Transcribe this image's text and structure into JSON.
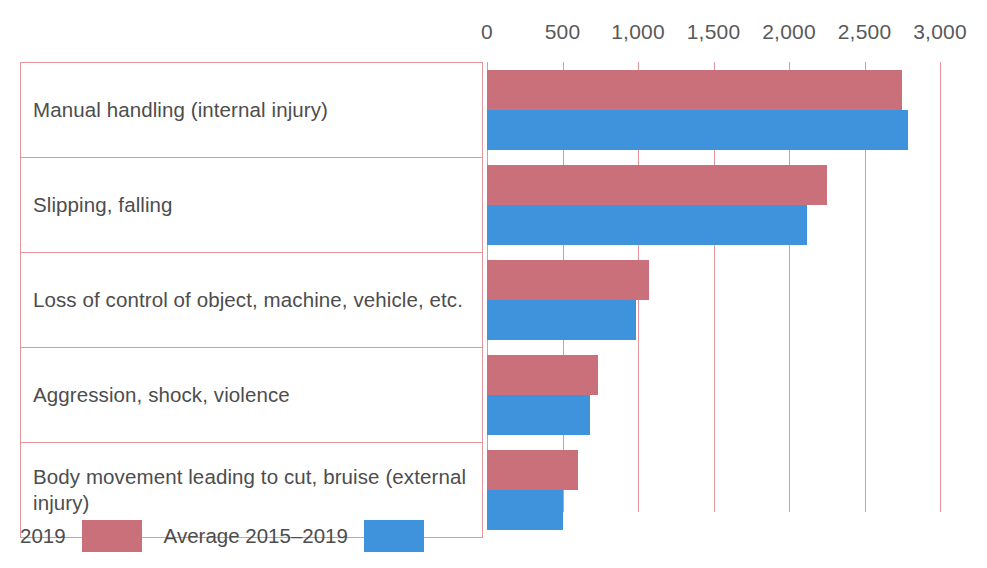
{
  "chart_data": {
    "type": "bar",
    "orientation": "horizontal",
    "title": "",
    "subtitle": "",
    "xlabel": "",
    "ylabel": "",
    "xlim": [
      0,
      3000
    ],
    "grid": true,
    "legend_position": "bottom-left",
    "categories": [
      "Manual handling (internal injury)",
      "Slipping, falling",
      "Loss of control of object, machine, vehicle, etc.",
      "Aggression, shock, violence",
      "Body movement leading to cut, bruise (external injury)"
    ],
    "tick_labels": [
      "0",
      "500",
      "1,000",
      "1,500",
      "2,000",
      "2,500",
      "3,000"
    ],
    "tick_values": [
      0,
      500,
      1000,
      1500,
      2000,
      2500,
      3000
    ],
    "series": [
      {
        "name": "2019",
        "color": "#c9707a",
        "values": [
          2750,
          2250,
          1070,
          735,
          600
        ]
      },
      {
        "name": "Average 2015–2019",
        "color": "#3f93dc",
        "values": [
          2790,
          2120,
          990,
          680,
          500
        ]
      }
    ]
  },
  "legend": {
    "items": [
      {
        "label": "2019",
        "color": "#c9707a"
      },
      {
        "label": "Average 2015–2019",
        "color": "#3f93dc"
      }
    ]
  },
  "colors": {
    "series_2019": "#c9707a",
    "series_average": "#3f93dc",
    "gridline": "#e4959c",
    "table_border": "#e4959c",
    "text": "#4d4d4d",
    "axis_text": "#595959",
    "background": "#ffffff"
  }
}
